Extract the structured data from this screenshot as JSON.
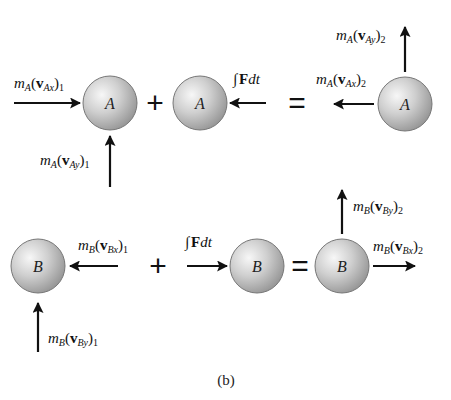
{
  "figure": {
    "caption": "(b)",
    "colors": {
      "ball_light": "#f2f2f2",
      "ball_mid": "#c4c4c4",
      "ball_dark": "#8a8a8a",
      "arrow": "#111111"
    }
  },
  "row_a": {
    "ball_letter": "A",
    "initial": {
      "x_momentum": {
        "m": "m",
        "m_sub": "A",
        "v": "v",
        "v_sub": "Ax",
        "paren_sub": "1"
      },
      "y_momentum": {
        "m": "m",
        "m_sub": "A",
        "v": "v",
        "v_sub": "Ay",
        "paren_sub": "1"
      }
    },
    "impulse": {
      "integral": "∫",
      "F": "F",
      "dt": "dt"
    },
    "final": {
      "x_momentum": {
        "m": "m",
        "m_sub": "A",
        "v": "v",
        "v_sub": "Ax",
        "paren_sub": "2"
      },
      "y_momentum": {
        "m": "m",
        "m_sub": "A",
        "v": "v",
        "v_sub": "Ay",
        "paren_sub": "2"
      }
    },
    "plus": "+",
    "equals": "="
  },
  "row_b": {
    "ball_letter": "B",
    "initial": {
      "x_momentum": {
        "m": "m",
        "m_sub": "B",
        "v": "v",
        "v_sub": "Bx",
        "paren_sub": "1"
      },
      "y_momentum": {
        "m": "m",
        "m_sub": "B",
        "v": "v",
        "v_sub": "By",
        "paren_sub": "1"
      }
    },
    "impulse": {
      "integral": "∫",
      "F": "F",
      "dt": "dt"
    },
    "final": {
      "x_momentum": {
        "m": "m",
        "m_sub": "B",
        "v": "v",
        "v_sub": "Bx",
        "paren_sub": "2"
      },
      "y_momentum": {
        "m": "m",
        "m_sub": "B",
        "v": "v",
        "v_sub": "By",
        "paren_sub": "2"
      }
    },
    "plus": "+",
    "equals": "="
  }
}
